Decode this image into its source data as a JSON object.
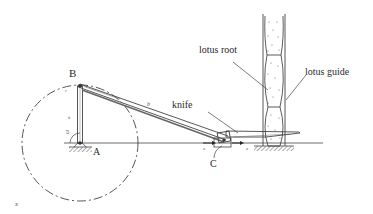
{
  "diagram": {
    "type": "mechanism-schematic",
    "colors": {
      "line": "#3a3a3a",
      "hatch": "#555555",
      "background": "#ffffff",
      "dot": "#666666"
    },
    "labels": {
      "point_b": "B",
      "point_a": "A",
      "point_c": "C",
      "knife": "knife",
      "lotus_root": "lotus root",
      "lotus_guide": "lotus guide",
      "crank_r": "r",
      "crank_a": "a",
      "omega": "ω",
      "link_b": "b",
      "slider_x1": "x",
      "slider_x2": "x",
      "corner_x": "x"
    }
  }
}
